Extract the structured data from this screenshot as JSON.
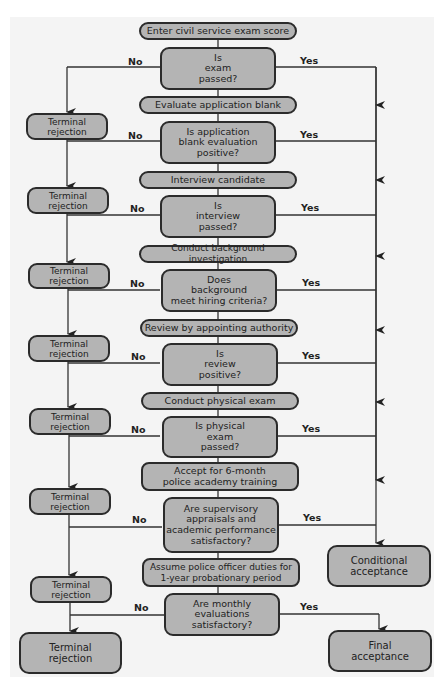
{
  "flowchart": {
    "start": "Enter civil service exam score",
    "steps": [
      {
        "decision": "Is\nexam\npassed?",
        "next_step": "Evaluate application blank"
      },
      {
        "decision": "Is application\nblank evaluation\npositive?",
        "next_step": "Interview candidate"
      },
      {
        "decision": "Is\ninterview\npassed?",
        "next_step": "Conduct background investigation"
      },
      {
        "decision": "Does\nbackground\nmeet hiring criteria?",
        "next_step": "Review by appointing authority"
      },
      {
        "decision": "Is\nreview\npositive?",
        "next_step": "Conduct physical exam"
      },
      {
        "decision": "Is physical\nexam\npassed?",
        "next_step": "Accept for 6-month\npolice academy training"
      },
      {
        "decision": "Are supervisory\nappraisals and\nacademic performance\nsatisfactory?",
        "next_step": "Assume police officer duties for\n1-year probationary period"
      },
      {
        "decision": "Are monthly\nevaluations\nsatisfactory?"
      }
    ],
    "no_label": "No",
    "yes_label": "Yes",
    "terminal_rejection": "Terminal\nrejection",
    "conditional_acceptance": "Conditional\nacceptance",
    "final_acceptance": "Final\nacceptance"
  },
  "colors": {
    "node_fill": "#b4b4b4",
    "node_border": "#2b2b2b",
    "panel_bg": "#f4f4f4",
    "line": "#333333"
  }
}
